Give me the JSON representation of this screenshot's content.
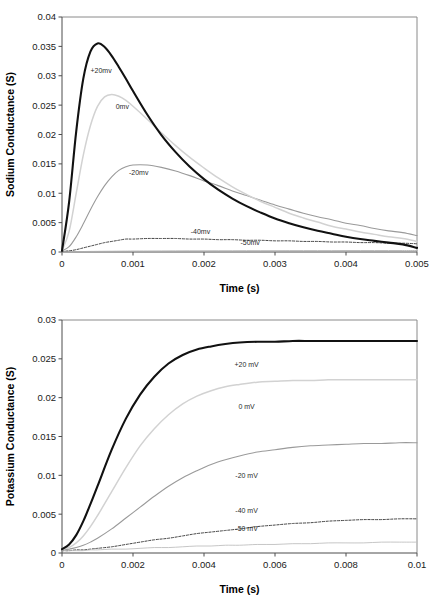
{
  "figure": {
    "background": "#ffffff",
    "panels": [
      "sodium",
      "potassium"
    ]
  },
  "chart_data": [
    {
      "id": "sodium",
      "type": "line",
      "title": "",
      "xlabel": "Time (s)",
      "ylabel": "Sodium Conductance (S)",
      "xlim": [
        0,
        0.005
      ],
      "ylim": [
        0,
        0.04
      ],
      "xticks": [
        0,
        0.001,
        0.002,
        0.003,
        0.004,
        0.005
      ],
      "xticklabels": [
        "0",
        "0.001",
        "0.002",
        "0.003",
        "0.004",
        "0.005"
      ],
      "yticks": [
        0,
        0.005,
        0.01,
        0.015,
        0.02,
        0.025,
        0.03,
        0.035,
        0.04
      ],
      "yticklabels": [
        "0",
        "0.005",
        "0.01",
        "0.015",
        "0.02",
        "0.025",
        "0.03",
        "0.035",
        "0.04"
      ],
      "grid": false,
      "legend_position": "inline-annotations",
      "x": [
        0,
        0.0001,
        0.0002,
        0.0003,
        0.0004,
        0.0005,
        0.0006,
        0.0007,
        0.0008,
        0.0009,
        0.001,
        0.0012,
        0.0014,
        0.0016,
        0.0018,
        0.002,
        0.0022,
        0.0024,
        0.0026,
        0.0028,
        0.003,
        0.0032,
        0.0034,
        0.0036,
        0.0038,
        0.004,
        0.0042,
        0.0044,
        0.0046,
        0.0048,
        0.005
      ],
      "series": [
        {
          "name": "+20mv",
          "label": "+20mv",
          "color": "#111111",
          "width": 2.1,
          "dash": "none",
          "label_x": 0.00055,
          "label_y": 0.0305,
          "peak_x": 0.0005,
          "peak_y": 0.0355,
          "values": [
            0.0002,
            0.0085,
            0.0205,
            0.0295,
            0.0341,
            0.0355,
            0.0349,
            0.0334,
            0.0315,
            0.0295,
            0.0274,
            0.0234,
            0.0199,
            0.017,
            0.0145,
            0.0124,
            0.0106,
            0.0091,
            0.0078,
            0.0067,
            0.0057,
            0.0049,
            0.0042,
            0.0036,
            0.0031,
            0.0026,
            0.0022,
            0.0019,
            0.0016,
            0.0013,
            0.0007
          ]
        },
        {
          "name": "0mv",
          "label": "0mv",
          "color": "#d2d2d2",
          "width": 1.5,
          "dash": "none",
          "label_x": 0.00085,
          "label_y": 0.0243,
          "peak_x": 0.00067,
          "peak_y": 0.0268,
          "values": [
            0.0002,
            0.0035,
            0.01,
            0.0165,
            0.0215,
            0.0248,
            0.0264,
            0.0268,
            0.0265,
            0.0258,
            0.0248,
            0.0226,
            0.0203,
            0.0181,
            0.0161,
            0.0143,
            0.0126,
            0.0111,
            0.0098,
            0.0086,
            0.0076,
            0.0066,
            0.0058,
            0.0051,
            0.0044,
            0.0039,
            0.0034,
            0.003,
            0.0026,
            0.0023,
            0.0018
          ]
        },
        {
          "name": "-20mv",
          "label": "-20mv",
          "color": "#9a9a9a",
          "width": 1.1,
          "dash": "none",
          "label_x": 0.00108,
          "label_y": 0.0131,
          "peak_x": 0.001,
          "peak_y": 0.0148,
          "values": [
            0.0002,
            0.0009,
            0.0026,
            0.0048,
            0.0072,
            0.0094,
            0.0113,
            0.0128,
            0.0139,
            0.0145,
            0.0148,
            0.0148,
            0.0144,
            0.0138,
            0.013,
            0.0121,
            0.0113,
            0.0104,
            0.0096,
            0.0088,
            0.008,
            0.0073,
            0.0066,
            0.006,
            0.0055,
            0.0049,
            0.0045,
            0.004,
            0.0036,
            0.0033,
            0.0028
          ]
        },
        {
          "name": "-40mv",
          "label": "-40mv",
          "color": "#2f2f2f",
          "width": 0.9,
          "dash": "2.2,1.6",
          "label_x": 0.00195,
          "label_y": 0.003,
          "peak_x": 0.0014,
          "peak_y": 0.0023,
          "values": [
            0.0001,
            0.0002,
            0.0004,
            0.0007,
            0.001,
            0.0013,
            0.0016,
            0.0018,
            0.002,
            0.0022,
            0.0022,
            0.0023,
            0.0023,
            0.0023,
            0.0022,
            0.0022,
            0.0021,
            0.0021,
            0.002,
            0.002,
            0.0019,
            0.0019,
            0.0018,
            0.0018,
            0.0017,
            0.0017,
            0.0016,
            0.0016,
            0.0015,
            0.0015,
            0.0014
          ]
        },
        {
          "name": "-50mv",
          "label": "-50mv",
          "color": "#b0b0b0",
          "width": 0.9,
          "dash": "none",
          "label_x": 0.00265,
          "label_y": 0.0012,
          "peak_x": 0.005,
          "peak_y": 0.0002,
          "values": [
            2e-05,
            4e-05,
            6e-05,
            8e-05,
            0.0001,
            0.00011,
            0.00012,
            0.00013,
            0.00014,
            0.00015,
            0.00016,
            0.00017,
            0.00018,
            0.00019,
            0.0002,
            0.0002,
            0.00021,
            0.00021,
            0.00022,
            0.00022,
            0.00022,
            0.00023,
            0.00023,
            0.00023,
            0.00023,
            0.00024,
            0.00024,
            0.00024,
            0.00024,
            0.00024,
            0.00024
          ]
        }
      ]
    },
    {
      "id": "potassium",
      "type": "line",
      "title": "",
      "xlabel": "Time (s)",
      "ylabel": "Potassium Conductance (S)",
      "xlim": [
        0,
        0.01
      ],
      "ylim": [
        0,
        0.03
      ],
      "xticks": [
        0,
        0.002,
        0.004,
        0.006,
        0.008,
        0.01
      ],
      "xticklabels": [
        "0",
        "0.002",
        "0.004",
        "0.006",
        "0.008",
        "0.01"
      ],
      "yticks": [
        0,
        0.005,
        0.01,
        0.015,
        0.02,
        0.025,
        0.03
      ],
      "yticklabels": [
        "0",
        "0.005",
        "0.01",
        "0.015",
        "0.02",
        "0.025",
        "0.03"
      ],
      "grid": false,
      "legend_position": "inline-annotations",
      "x": [
        0,
        0.0002,
        0.0004,
        0.0006,
        0.0008,
        0.001,
        0.0014,
        0.0018,
        0.0022,
        0.0026,
        0.003,
        0.0034,
        0.0038,
        0.0042,
        0.0046,
        0.005,
        0.0055,
        0.006,
        0.0065,
        0.007,
        0.0075,
        0.008,
        0.0085,
        0.009,
        0.0095,
        0.01
      ],
      "series": [
        {
          "name": "+20 mV",
          "label": "+20 mV",
          "color": "#111111",
          "width": 2.1,
          "dash": "none",
          "label_x": 0.0052,
          "label_y": 0.024,
          "plateau": 0.0273,
          "values": [
            0.0005,
            0.0011,
            0.0023,
            0.0041,
            0.0063,
            0.0086,
            0.0133,
            0.0173,
            0.0204,
            0.0227,
            0.0244,
            0.0255,
            0.0262,
            0.0266,
            0.0269,
            0.0271,
            0.0272,
            0.0272,
            0.0273,
            0.0273,
            0.0273,
            0.0273,
            0.0273,
            0.0273,
            0.0273,
            0.0273
          ]
        },
        {
          "name": "0 mV",
          "label": "0 mV",
          "color": "#d2d2d2",
          "width": 1.5,
          "dash": "none",
          "label_x": 0.0052,
          "label_y": 0.0185,
          "plateau": 0.0223,
          "values": [
            0.0005,
            0.0007,
            0.0013,
            0.0022,
            0.0034,
            0.0048,
            0.0079,
            0.011,
            0.0138,
            0.016,
            0.0178,
            0.0192,
            0.0202,
            0.0209,
            0.0214,
            0.0217,
            0.022,
            0.0221,
            0.0222,
            0.0222,
            0.0223,
            0.0223,
            0.0223,
            0.0223,
            0.0223,
            0.0223
          ]
        },
        {
          "name": "-20 mV",
          "label": "-20 mV",
          "color": "#9a9a9a",
          "width": 1.1,
          "dash": "none",
          "label_x": 0.0052,
          "label_y": 0.0096,
          "plateau": 0.0142,
          "values": [
            0.0004,
            0.0005,
            0.0007,
            0.001,
            0.0014,
            0.0019,
            0.0031,
            0.0045,
            0.0059,
            0.0073,
            0.0086,
            0.0097,
            0.0106,
            0.0114,
            0.012,
            0.0125,
            0.013,
            0.0133,
            0.0136,
            0.0138,
            0.0139,
            0.014,
            0.0141,
            0.0141,
            0.0142,
            0.0142
          ]
        },
        {
          "name": "-40 mV",
          "label": "-40 mV",
          "color": "#2f2f2f",
          "width": 0.9,
          "dash": "2.2,1.6",
          "label_x": 0.0052,
          "label_y": 0.0051,
          "plateau": 0.0044,
          "values": [
            0.0003,
            0.0003,
            0.0004,
            0.0004,
            0.0005,
            0.0006,
            0.0008,
            0.0011,
            0.0014,
            0.0017,
            0.0019,
            0.0022,
            0.0025,
            0.0027,
            0.0029,
            0.0031,
            0.0034,
            0.0036,
            0.0038,
            0.0039,
            0.0041,
            0.0042,
            0.0043,
            0.0043,
            0.0044,
            0.0044
          ]
        },
        {
          "name": "-50 mV",
          "label": "-50 mV",
          "color": "#c0c0c0",
          "width": 0.9,
          "dash": "none",
          "label_x": 0.0052,
          "label_y": 0.0028,
          "plateau": 0.0014,
          "values": [
            0.0003,
            0.0003,
            0.0003,
            0.0003,
            0.0004,
            0.0004,
            0.0005,
            0.0005,
            0.0006,
            0.0007,
            0.0007,
            0.0008,
            0.0009,
            0.0009,
            0.001,
            0.001,
            0.0011,
            0.0011,
            0.0012,
            0.0012,
            0.0013,
            0.0013,
            0.0013,
            0.0014,
            0.0014,
            0.0014
          ]
        }
      ]
    }
  ]
}
